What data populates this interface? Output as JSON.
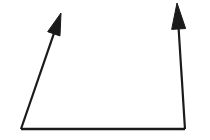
{
  "figure": {
    "background_color": "#ffffff",
    "stroke_color": "#1a1a1a",
    "canvas": {
      "width": 210,
      "height": 140
    }
  },
  "chart_data": {
    "type": "diagram",
    "title": "",
    "xlabel": "",
    "ylabel": "",
    "grid": false,
    "legend": null,
    "annotations": [],
    "elements": [
      {
        "name": "base-line",
        "kind": "line",
        "x1": 21,
        "y1": 129,
        "x2": 185,
        "y2": 129,
        "stroke": "#1a1a1a",
        "stroke_width": 2.4,
        "arrowhead": "none",
        "label": ""
      },
      {
        "name": "left-arrow",
        "kind": "arrow",
        "x1": 21,
        "y1": 129,
        "x2": 61,
        "y2": 13,
        "stroke": "#1a1a1a",
        "stroke_width": 2.2,
        "arrowhead": "end",
        "head_length": 22,
        "head_width": 13,
        "label": ""
      },
      {
        "name": "right-arrow",
        "kind": "arrow",
        "x1": 185,
        "y1": 129,
        "x2": 177,
        "y2": 3,
        "stroke": "#1a1a1a",
        "stroke_width": 2.2,
        "arrowhead": "end",
        "head_length": 26,
        "head_width": 14,
        "label": ""
      }
    ]
  }
}
